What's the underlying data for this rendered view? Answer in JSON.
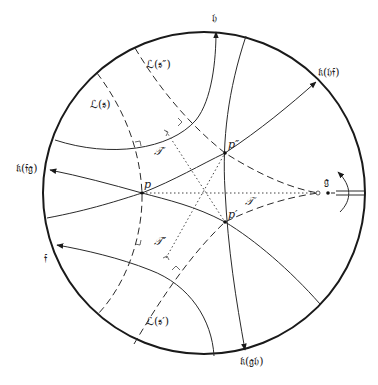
{
  "figure": {
    "type": "hyperbolic-disk-diagram",
    "colors": {
      "stroke": "#2a2a2a",
      "background": "#ffffff"
    },
    "labels": {
      "h": "𝔥",
      "k_hf": "𝔨(𝔥𝔣)",
      "k_fg": "𝔨(𝔣𝔤)",
      "f": "𝔣",
      "k_gh": "𝔨(𝔤𝔥)",
      "g": "𝔤",
      "L_s": "ℒ(𝔰)",
      "L_s2": "ℒ(𝔰″)",
      "L_s1": "ℒ(𝔰′)",
      "T": "𝒯",
      "T1": "𝒯′",
      "T2": "𝒯″",
      "p": "p",
      "p1": "p′",
      "p2": "p″"
    }
  }
}
